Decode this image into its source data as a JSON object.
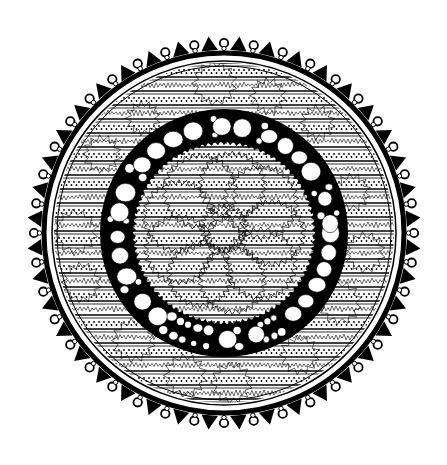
{
  "image": {
    "subject": "black and white mandala line drawing",
    "width": 447,
    "height": 465,
    "background": "#ffffff",
    "ink": "#000000"
  },
  "mandala": {
    "center": [
      224,
      233
    ],
    "outer_border": {
      "r_circle": 190,
      "count": 40,
      "circle_r": 4.2,
      "spike_r": 197
    },
    "thick_ring": {
      "r": 180,
      "width": 5
    },
    "thin_ring": {
      "r": 172,
      "width": 1.5
    },
    "striped_band": {
      "r_outer": 170,
      "r_inner": 122,
      "stripe_spacing": 14
    },
    "bead_ring": {
      "r_outer": 121,
      "r_inner": 92,
      "outline_width": 4
    },
    "serrated_edge": {
      "r": 90,
      "teeth": 90
    },
    "center_zigzags": {
      "count": 9,
      "r": 30,
      "orbit": 48
    }
  }
}
